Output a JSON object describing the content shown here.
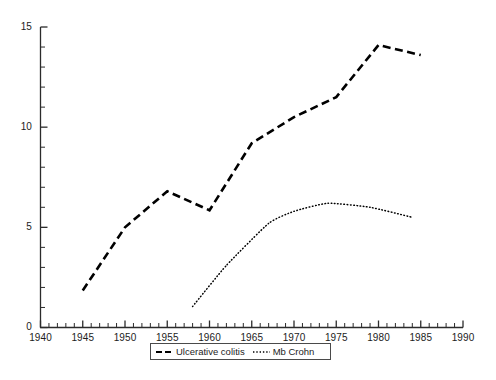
{
  "chart_data": {
    "type": "line",
    "title": "",
    "subtitle": "",
    "xlabel": "",
    "ylabel": "",
    "xlim": [
      1940,
      1990
    ],
    "ylim": [
      0,
      15
    ],
    "x_major_ticks": [
      1940,
      1945,
      1950,
      1955,
      1960,
      1965,
      1970,
      1975,
      1980,
      1985,
      1990
    ],
    "x_minor_tick_step": 1,
    "y_major_ticks": [
      0,
      5,
      10,
      15
    ],
    "y_minor_tick_step": 1,
    "grid": false,
    "legend_position": "bottom-center",
    "series": [
      {
        "name": "Ulcerative colitis",
        "style": "dashed",
        "color": "#000000",
        "x": [
          1945,
          1950,
          1955,
          1960,
          1965,
          1970,
          1975,
          1980,
          1985
        ],
        "values": [
          1.85,
          5.0,
          6.8,
          5.85,
          9.2,
          10.5,
          11.5,
          14.1,
          13.6
        ]
      },
      {
        "name": "Mb Crohn",
        "style": "dotted",
        "color": "#000000",
        "x": [
          1958,
          1962,
          1967,
          1970,
          1974,
          1979,
          1984
        ],
        "values": [
          1.05,
          3.1,
          5.2,
          5.8,
          6.2,
          6.0,
          5.5
        ]
      }
    ]
  },
  "axes": {
    "y_tick_labels": [
      "0",
      "5",
      "10",
      "15"
    ],
    "x_tick_labels": [
      "1940",
      "1945",
      "1950",
      "1955",
      "1960",
      "1965",
      "1970",
      "1975",
      "1980",
      "1985",
      "1990"
    ]
  },
  "legend": {
    "entries": [
      {
        "label": "Ulcerative colitis",
        "style": "dashed"
      },
      {
        "label": "Mb Crohn",
        "style": "dotted"
      }
    ]
  },
  "colors": {
    "axis": "#2b2b2b",
    "series_ulcerative_colitis": "#000000",
    "series_mb_crohn": "#000000",
    "background": "#ffffff",
    "legend_border": "#4a4a4a"
  }
}
